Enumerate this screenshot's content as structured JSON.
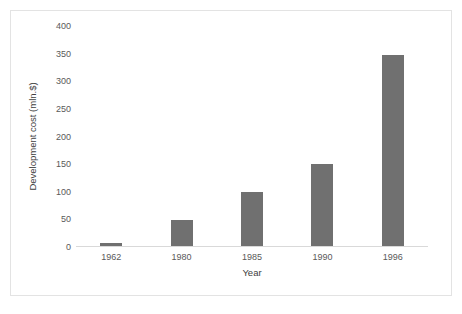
{
  "chart_data": {
    "type": "bar",
    "title": "",
    "subtitle": "",
    "xlabel": "Year",
    "ylabel": "Development cost (mln.$)",
    "categories": [
      "1962",
      "1980",
      "1985",
      "1990",
      "1996"
    ],
    "values": [
      7,
      48,
      100,
      150,
      347
    ],
    "series": [
      {
        "name": "Development cost",
        "values": [
          7,
          48,
          100,
          150,
          347
        ]
      }
    ],
    "ylim": [
      0,
      400
    ],
    "ytick_labels": [
      "400",
      "350",
      "300",
      "250",
      "200",
      "150",
      "100",
      "50",
      "0"
    ],
    "ytick_values": [
      400,
      350,
      300,
      250,
      200,
      150,
      100,
      50,
      0
    ],
    "grid": false,
    "legend": false,
    "legend_position": "none",
    "annotations": [],
    "colors": {
      "bar": "#707070",
      "axis_line": "#d9d9d9",
      "tick_label": "#595959",
      "axis_title": "#404040",
      "frame_border": "#e3e3e3",
      "background": "#ffffff"
    }
  }
}
